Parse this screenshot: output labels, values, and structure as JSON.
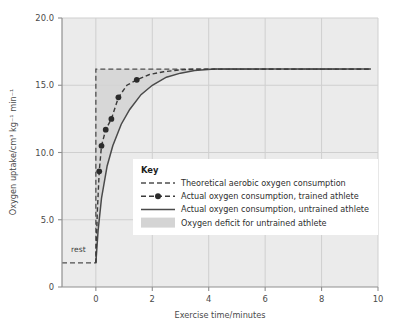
{
  "chart_data": {
    "type": "line",
    "title": "",
    "xlabel": "Exercise time/minutes",
    "ylabel": "Oxygen uptake/cm³ kg⁻¹ min⁻¹",
    "xlim": [
      -1.2,
      10.0
    ],
    "ylim": [
      0,
      20.0
    ],
    "xticks": [
      0,
      2,
      4,
      6,
      8,
      10
    ],
    "xtick_labels": [
      "0",
      "2",
      "4",
      "6",
      "8",
      "10"
    ],
    "yticks": [
      0,
      5.0,
      10.0,
      15.0,
      20.0
    ],
    "ytick_labels": [
      "0",
      "5.0",
      "10.0",
      "15.0",
      "20.0"
    ],
    "grid": true,
    "legend_position": "center-right-inside",
    "annotations": [
      {
        "text": "rest",
        "x": -0.95,
        "y": 2.6
      }
    ],
    "plateau_value": 16.2,
    "rest_value": 1.8,
    "series": [
      {
        "name": "Theoretical aerobic oxygen consumption",
        "style": "dashed",
        "color": "#4f4f4f",
        "x": [
          -1.2,
          0.0,
          0.0,
          9.75
        ],
        "y": [
          1.8,
          1.8,
          16.2,
          16.2
        ]
      },
      {
        "name": "Actual oxygen consumption, trained athlete",
        "style": "dashed-with-markers",
        "color": "#3a3a3a",
        "x": [
          0.0,
          0.05,
          0.12,
          0.2,
          0.35,
          0.55,
          0.8,
          1.1,
          1.45,
          1.9,
          2.4,
          3.0,
          3.6,
          4.3,
          5.5,
          7.0,
          9.75
        ],
        "y": [
          1.8,
          5.5,
          8.6,
          10.5,
          11.7,
          12.5,
          14.1,
          15.0,
          15.4,
          15.8,
          16.0,
          16.15,
          16.2,
          16.2,
          16.2,
          16.2,
          16.2
        ],
        "markers_x": [
          0.12,
          0.2,
          0.35,
          0.55,
          0.8,
          1.45
        ],
        "markers_y": [
          8.6,
          10.5,
          11.7,
          12.5,
          14.1,
          15.4
        ]
      },
      {
        "name": "Actual oxygen consumption, untrained athlete",
        "style": "solid",
        "color": "#4a4a4a",
        "x": [
          0.0,
          0.08,
          0.2,
          0.4,
          0.6,
          0.9,
          1.2,
          1.6,
          2.0,
          2.5,
          3.0,
          3.5,
          4.2,
          5.0,
          6.5,
          8.0,
          9.75
        ],
        "y": [
          1.8,
          4.2,
          6.6,
          9.0,
          10.5,
          12.1,
          13.2,
          14.3,
          15.0,
          15.6,
          15.9,
          16.1,
          16.2,
          16.2,
          16.2,
          16.2,
          16.2
        ]
      },
      {
        "name": "Oxygen deficit for untrained athlete",
        "style": "shaded-area",
        "color": "#d3d3d3"
      }
    ]
  },
  "legend": {
    "title": "Key",
    "items": [
      {
        "label": "Theoretical aerobic oxygen consumption",
        "marker": "dashed-line"
      },
      {
        "label": "Actual oxygen consumption, trained athlete",
        "marker": "dashed-line-dot"
      },
      {
        "label": "Actual oxygen consumption, untrained athlete",
        "marker": "solid-line"
      },
      {
        "label": "Oxygen deficit for untrained athlete",
        "marker": "shaded-swatch"
      }
    ]
  },
  "colors": {
    "plot_background": "#ebebeb",
    "grid": "#cfcfcf",
    "axis": "#8f8f8f",
    "line_dark": "#4a4a4a",
    "shade": "#d4d4d4",
    "legend_background": "#ffffff",
    "text": "#3a3a3a"
  }
}
